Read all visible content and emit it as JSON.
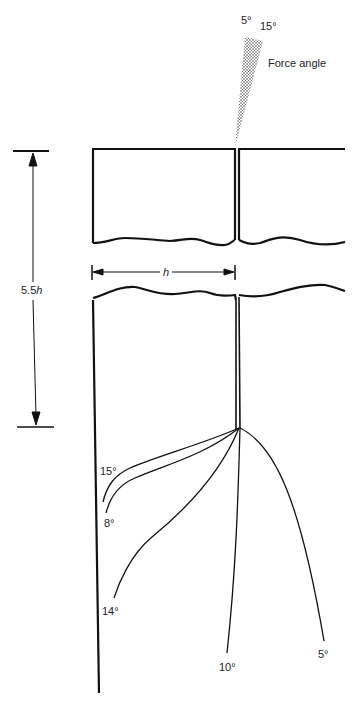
{
  "figure": {
    "force_angle": {
      "label": "Force angle",
      "angle_low": "5°",
      "angle_high": "15°"
    },
    "dimensions": {
      "height_label_prefix": "5.5",
      "height_label_var": "h",
      "width_label": "h"
    },
    "crack_paths": [
      {
        "angle": "15°"
      },
      {
        "angle": "8°"
      },
      {
        "angle": "14°"
      },
      {
        "angle": "10°"
      },
      {
        "angle": "5°"
      }
    ],
    "colors": {
      "line": "#111111",
      "stipple": "#444444"
    }
  }
}
